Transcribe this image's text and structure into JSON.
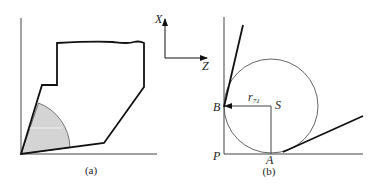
{
  "panels": [
    {
      "caption": "(a)",
      "description": "Cross-section outline with shaded circular sector at the corner"
    },
    {
      "caption": "(b)",
      "description": "Circle tangent to two walls with radius arrow from center to contact point"
    }
  ],
  "axes": {
    "x_label": "X",
    "z_label": "Z"
  },
  "points": {
    "b": "B",
    "s": "S",
    "p": "P",
    "a": "A"
  },
  "radius_label": {
    "base": "r",
    "subscript": "71"
  },
  "colors": {
    "stroke": "#111111",
    "shade": "#d4d4d4",
    "background": "#ffffff"
  }
}
